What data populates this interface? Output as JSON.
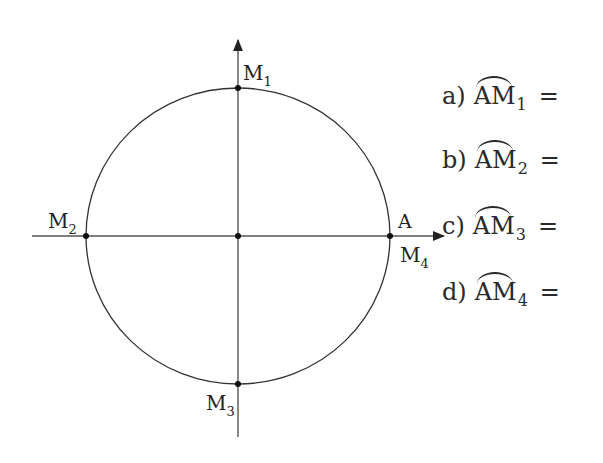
{
  "diagram": {
    "type": "trigonometric-circle",
    "center": {
      "x": 238,
      "y": 236
    },
    "radius": 150,
    "points": [
      {
        "id": "M1",
        "label": "M",
        "sub": "1",
        "position": "top"
      },
      {
        "id": "M2",
        "label": "M",
        "sub": "2",
        "position": "left"
      },
      {
        "id": "M3",
        "label": "M",
        "sub": "3",
        "position": "bottom"
      },
      {
        "id": "M4",
        "label": "M",
        "sub": "4",
        "position": "right"
      },
      {
        "id": "A",
        "label": "A",
        "position": "right"
      }
    ],
    "labels": {
      "M1": "M",
      "M1_sub": "1",
      "M2": "M",
      "M2_sub": "2",
      "M3": "M",
      "M3_sub": "3",
      "M4": "M",
      "M4_sub": "4",
      "A": "A"
    }
  },
  "questions": [
    {
      "letter": "a)",
      "arc": "AM",
      "sub": "1",
      "eq": "="
    },
    {
      "letter": "b)",
      "arc": "AM",
      "sub": "2",
      "eq": "="
    },
    {
      "letter": "c)",
      "arc": "AM",
      "sub": "3",
      "eq": "="
    },
    {
      "letter": "d)",
      "arc": "AM",
      "sub": "4",
      "eq": "="
    }
  ],
  "colors": {
    "stroke": "#333333",
    "text": "#222222",
    "background": "#ffffff"
  }
}
